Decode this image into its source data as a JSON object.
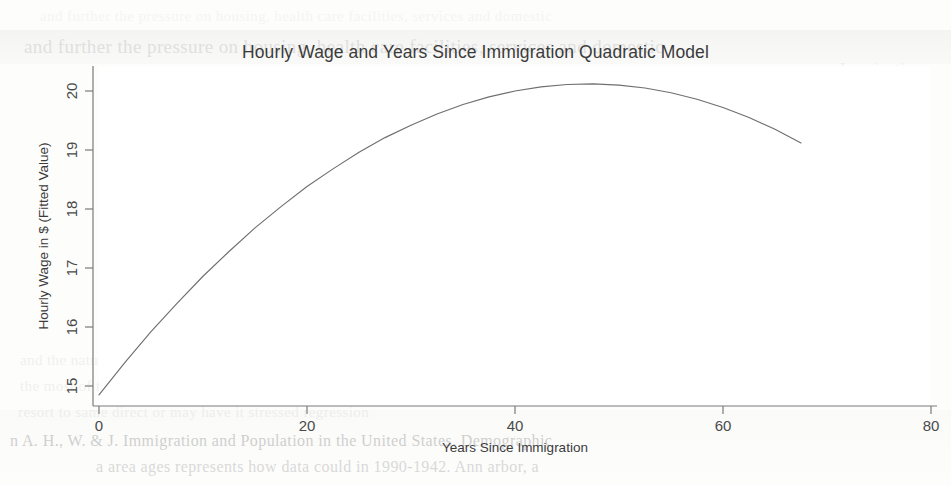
{
  "figure": {
    "title": "Hourly Wage and Years Since Immigration Quadratic Model",
    "xlabel": "Years Since Immigration",
    "ylabel": "Hourly Wage in $ (Fitted Value)",
    "background_color": "#ffffff",
    "line_color": "#6f6f70",
    "axis_color": "#7b7b7b"
  },
  "axes": {
    "x_ticks": [
      "0",
      "20",
      "40",
      "60",
      "80"
    ],
    "y_ticks": [
      "15",
      "16",
      "17",
      "18",
      "19",
      "20"
    ]
  },
  "scan_artifacts": {
    "line_1": "and further the pressure on housing, health care facilities, services and domestic",
    "line_2": "Imaginations",
    "line_3": "the main Asian immigrants and the changes in Europe and Asia",
    "line_4": "the populations of the United States. The larger quantity",
    "line_5": "countries and the quantity of immigrants in the",
    "line_6": "the types and how to apply to",
    "line_7": "in the period of immigration",
    "line_8": "also, in a the US  Canada",
    "line_9": "and the natural relations of the wages for  without",
    "line_10": "the most of the indicators of the immigration from both the sides",
    "line_11": "resort to same direct or may have it stressed regression",
    "line_12": "n A. H., W. & J. Immigration and Population in the United States. Demographic",
    "line_13": "a area ages represents how data could in 1990-1942. Ann arbor, a"
  },
  "chart_data": {
    "type": "line",
    "title": "Hourly Wage and Years Since Immigration Quadratic Model",
    "xlabel": "Years Since Immigration",
    "ylabel": "Hourly Wage in $ (Fitted Value)",
    "xlim": [
      0,
      80
    ],
    "ylim": [
      14.6,
      20.45
    ],
    "xticks": [
      0,
      20,
      40,
      60,
      80
    ],
    "yticks": [
      15,
      16,
      17,
      18,
      19,
      20
    ],
    "grid": false,
    "legend": "none",
    "model": "quadratic",
    "fit_equation": "y = 14.85 + 0.2246*x - 0.002330*x^2",
    "vertex": {
      "x": 48.2,
      "y": 20.27
    },
    "series": [
      {
        "name": "Fitted value",
        "x": [
          0,
          2.5,
          5,
          7.5,
          10,
          12.5,
          15,
          17.5,
          20,
          22.5,
          25,
          27.5,
          30,
          32.5,
          35,
          37.5,
          40,
          42.5,
          45,
          47.5,
          50,
          52.5,
          55,
          57.5,
          60,
          62.5,
          65,
          67.5
        ],
        "y": [
          14.85,
          15.4,
          15.92,
          16.4,
          16.86,
          17.28,
          17.68,
          18.04,
          18.38,
          18.68,
          18.96,
          19.21,
          19.42,
          19.61,
          19.77,
          19.9,
          20.0,
          20.07,
          20.11,
          20.12,
          20.1,
          20.05,
          19.97,
          19.86,
          19.72,
          19.55,
          19.35,
          19.12
        ]
      }
    ]
  }
}
